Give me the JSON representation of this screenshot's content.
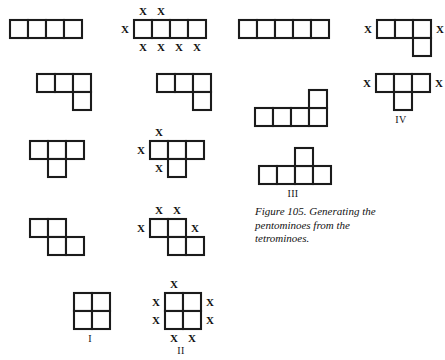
{
  "figure": {
    "caption": "Figure 105. Generating the pentominoes from the tetrominoes.",
    "cell_size": 18,
    "stroke_color": "#1b1b1b",
    "fill_color": "#ffffff",
    "marker_glyph": "X"
  },
  "columns": {
    "col1_title": "tetrominoes",
    "col2_title": "tetrominoes-with-growth-markers",
    "col3_title": "pentominoes",
    "col4_title": "pentominoes-with-markers"
  },
  "shapes": [
    {
      "id": "tetromino-i-bar",
      "name": "i-tetromino",
      "x": 8,
      "y": 18,
      "cells": [
        [
          0,
          0
        ],
        [
          1,
          0
        ],
        [
          2,
          0
        ],
        [
          3,
          0
        ]
      ],
      "markers": [],
      "label": ""
    },
    {
      "id": "tetromino-i-bar-marked",
      "name": "i-tetromino-marked",
      "x": 132,
      "y": 18,
      "cells": [
        [
          0,
          0
        ],
        [
          1,
          0
        ],
        [
          2,
          0
        ],
        [
          3,
          0
        ]
      ],
      "markers": [
        {
          "col": 0,
          "row": -1,
          "pos": "above"
        },
        {
          "col": 1,
          "row": -1,
          "pos": "above"
        },
        {
          "col": -1,
          "row": 0,
          "pos": "left"
        },
        {
          "col": 0,
          "row": 1,
          "pos": "below"
        },
        {
          "col": 1,
          "row": 1,
          "pos": "below"
        },
        {
          "col": 2,
          "row": 1,
          "pos": "below"
        },
        {
          "col": 3,
          "row": 1,
          "pos": "below"
        }
      ],
      "label": ""
    },
    {
      "id": "pentomino-i-bar",
      "name": "i-pentomino",
      "x": 237,
      "y": 18,
      "cells": [
        [
          0,
          0
        ],
        [
          1,
          0
        ],
        [
          2,
          0
        ],
        [
          3,
          0
        ],
        [
          4,
          0
        ]
      ],
      "markers": [],
      "label": ""
    },
    {
      "id": "pentomino-l-marked-top",
      "name": "l-pentomino-marked",
      "x": 375,
      "y": 18,
      "cells": [
        [
          0,
          0
        ],
        [
          1,
          0
        ],
        [
          2,
          0
        ],
        [
          2,
          1
        ]
      ],
      "markers": [
        {
          "col": -1,
          "row": 0,
          "pos": "left"
        },
        {
          "col": 3,
          "row": 0,
          "pos": "right"
        }
      ],
      "label": ""
    },
    {
      "id": "tetromino-l",
      "name": "l-tetromino",
      "x": 35,
      "y": 72,
      "cells": [
        [
          0,
          0
        ],
        [
          1,
          0
        ],
        [
          2,
          0
        ],
        [
          2,
          1
        ]
      ],
      "markers": [],
      "label": ""
    },
    {
      "id": "tetromino-l-right",
      "name": "l-tetromino-second",
      "x": 155,
      "y": 72,
      "cells": [
        [
          0,
          0
        ],
        [
          1,
          0
        ],
        [
          2,
          0
        ],
        [
          2,
          1
        ]
      ],
      "markers": [],
      "label": ""
    },
    {
      "id": "pentomino-l-long",
      "name": "l-pentomino-long",
      "x": 253,
      "y": 88,
      "cells": [
        [
          0,
          1
        ],
        [
          1,
          1
        ],
        [
          2,
          1
        ],
        [
          3,
          1
        ],
        [
          3,
          0
        ]
      ],
      "markers": [],
      "label": ""
    },
    {
      "id": "pentomino-t-marked",
      "name": "t-pentomino-marked",
      "x": 374,
      "y": 72,
      "cells": [
        [
          0,
          0
        ],
        [
          1,
          0
        ],
        [
          2,
          0
        ],
        [
          1,
          1
        ]
      ],
      "markers": [
        {
          "col": -1,
          "row": 0,
          "pos": "left"
        },
        {
          "col": 3,
          "row": 0,
          "pos": "right"
        }
      ],
      "label": "IV",
      "label_dx": 27,
      "label_dy": 42
    },
    {
      "id": "tetromino-t",
      "name": "t-tetromino",
      "x": 28,
      "y": 139,
      "cells": [
        [
          0,
          0
        ],
        [
          1,
          0
        ],
        [
          2,
          0
        ],
        [
          1,
          1
        ]
      ],
      "markers": [],
      "label": ""
    },
    {
      "id": "tetromino-t-marked",
      "name": "t-tetromino-marked",
      "x": 148,
      "y": 139,
      "cells": [
        [
          0,
          0
        ],
        [
          1,
          0
        ],
        [
          2,
          0
        ],
        [
          1,
          1
        ]
      ],
      "markers": [
        {
          "col": 0,
          "row": -1,
          "pos": "above"
        },
        {
          "col": -1,
          "row": 0,
          "pos": "left"
        },
        {
          "col": 0,
          "row": 1,
          "pos": "below"
        }
      ],
      "label": ""
    },
    {
      "id": "pentomino-t-iii",
      "name": "t-pentomino-iii",
      "x": 257,
      "y": 146,
      "cells": [
        [
          0,
          1
        ],
        [
          1,
          1
        ],
        [
          2,
          1
        ],
        [
          3,
          1
        ],
        [
          2,
          0
        ]
      ],
      "markers": [],
      "label": "III",
      "label_dx": 36,
      "label_dy": 42
    },
    {
      "id": "tetromino-s",
      "name": "s-tetromino",
      "x": 28,
      "y": 217,
      "cells": [
        [
          0,
          0
        ],
        [
          1,
          0
        ],
        [
          1,
          1
        ],
        [
          2,
          1
        ]
      ],
      "markers": [],
      "label": ""
    },
    {
      "id": "tetromino-s-marked",
      "name": "s-tetromino-marked",
      "x": 148,
      "y": 217,
      "cells": [
        [
          0,
          0
        ],
        [
          1,
          0
        ],
        [
          1,
          1
        ],
        [
          2,
          1
        ]
      ],
      "markers": [
        {
          "col": 0,
          "row": -1,
          "pos": "above"
        },
        {
          "col": 1,
          "row": -1,
          "pos": "above"
        },
        {
          "col": -1,
          "row": 0,
          "pos": "left"
        },
        {
          "col": 2,
          "row": 0,
          "pos": "right"
        }
      ],
      "label": ""
    },
    {
      "id": "tetromino-o",
      "name": "o-tetromino",
      "x": 72,
      "y": 291,
      "cells": [
        [
          0,
          0
        ],
        [
          1,
          0
        ],
        [
          0,
          1
        ],
        [
          1,
          1
        ]
      ],
      "markers": [],
      "label": "I",
      "label_dx": 18,
      "label_dy": 42
    },
    {
      "id": "tetromino-o-marked",
      "name": "o-tetromino-marked",
      "x": 163,
      "y": 291,
      "cells": [
        [
          0,
          0
        ],
        [
          1,
          0
        ],
        [
          0,
          1
        ],
        [
          1,
          1
        ]
      ],
      "markers": [
        {
          "col": 0,
          "row": -1,
          "pos": "above"
        },
        {
          "col": -1,
          "row": 0,
          "pos": "left"
        },
        {
          "col": -1,
          "row": 1,
          "pos": "left"
        },
        {
          "col": 2,
          "row": 0,
          "pos": "right"
        },
        {
          "col": 2,
          "row": 1,
          "pos": "right"
        },
        {
          "col": 0,
          "row": 2,
          "pos": "below"
        },
        {
          "col": 1,
          "row": 2,
          "pos": "below"
        }
      ],
      "label": "II",
      "label_dx": 18,
      "label_dy": 54
    }
  ]
}
